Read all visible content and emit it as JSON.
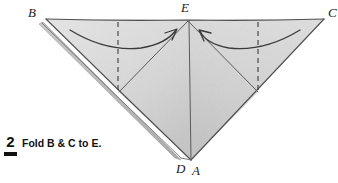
{
  "figure": {
    "step": {
      "number": "2",
      "instruction": "Fold B & C to E."
    },
    "labels": {
      "b": "B",
      "e": "E",
      "c": "C",
      "d": "D",
      "a": "A"
    },
    "colors": {
      "background": "#ffffff",
      "paper_light": "#e4e4e4",
      "paper_mid": "#d2d2d2",
      "paper_shadow": "#b9b9b9",
      "outline": "#4a4a4a",
      "fold_line": "#555555",
      "dashed_line": "#3d3d3d",
      "arrow": "#3a3a3a",
      "text": "#111111"
    },
    "geometry": {
      "vertex_b": [
        46,
        19
      ],
      "vertex_e": [
        188,
        20
      ],
      "vertex_c": [
        324,
        19
      ],
      "vertex_a": [
        191,
        160
      ],
      "vertex_d": [
        181,
        158
      ],
      "dashed_left_x": 118,
      "dashed_right_x": 258,
      "note": "Large inverted triangle B-C-A with apex E at top center; creases from E to lower-left and lower-right; vertical crease E to A; dashed vertical guide lines at the B and C fold quarters."
    },
    "arrows": [
      {
        "name": "fold-arrow-left",
        "direction": "left-to-right",
        "meaning": "Fold corner B over to E"
      },
      {
        "name": "fold-arrow-right",
        "direction": "right-to-left",
        "meaning": "Fold corner C over to E"
      }
    ]
  }
}
